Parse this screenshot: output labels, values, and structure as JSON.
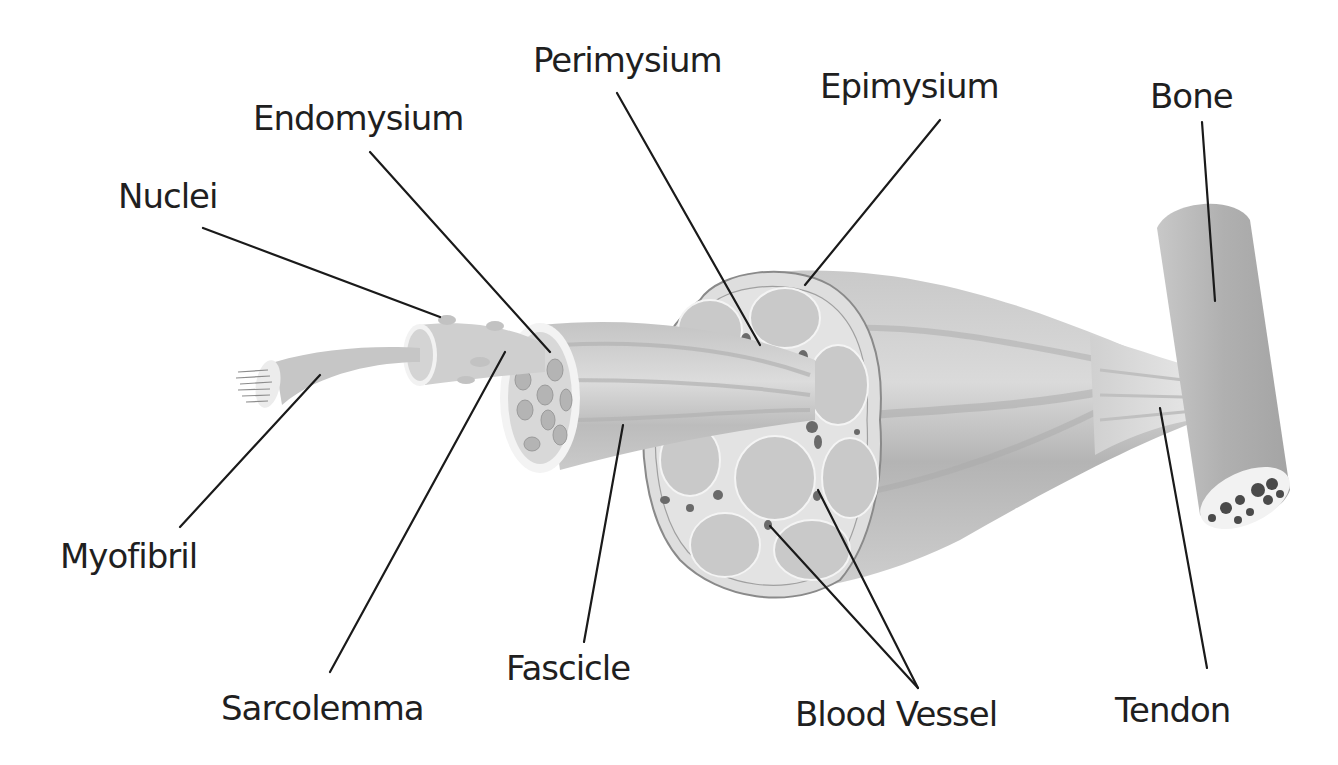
{
  "diagram": {
    "labels": {
      "perimysium": "Perimysium",
      "epimysium": "Epimysium",
      "bone": "Bone",
      "endomysium": "Endomysium",
      "nuclei": "Nuclei",
      "myofibril": "Myofibril",
      "sarcolemma": "Sarcolemma",
      "fascicle": "Fascicle",
      "blood_vessel": "Blood Vessel",
      "tendon": "Tendon"
    },
    "colors": {
      "background": "#ffffff",
      "text": "#1f1f1f",
      "leader_line": "#1a1a1a",
      "muscle_light": "#d8d8d8",
      "muscle_mid": "#bdbdbd",
      "muscle_dark": "#9e9e9e",
      "bone": "#b8b8b8",
      "marrow_spots": "#555555"
    }
  }
}
